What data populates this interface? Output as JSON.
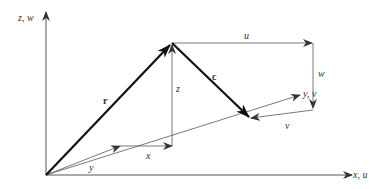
{
  "diagram": {
    "type": "vector-decomposition",
    "labels": {
      "z_axis": "z, w",
      "x_axis": "x, u",
      "y_axis": "y, v",
      "vector_r": "r",
      "vector_c": "c",
      "comp_u": "u",
      "comp_w": "w",
      "comp_v": "v",
      "comp_x": "x",
      "comp_y": "y",
      "comp_z": "z"
    },
    "colors": {
      "line": "#555555",
      "vector": "#1a1a1a",
      "background": "#ffffff"
    }
  }
}
